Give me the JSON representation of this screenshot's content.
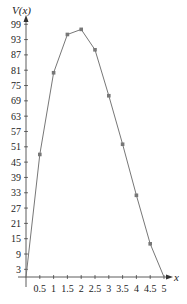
{
  "chart_data": {
    "type": "line",
    "title": "",
    "xlabel": "x",
    "ylabel": "V(x)",
    "x": [
      0,
      0.5,
      1,
      1.5,
      2,
      2.5,
      3,
      3.5,
      4,
      4.5,
      5
    ],
    "series": [
      {
        "name": "V(x)",
        "values": [
          0,
          48,
          80,
          95,
          97,
          89,
          71,
          52,
          32,
          13,
          0
        ]
      }
    ],
    "xlim": [
      0,
      5
    ],
    "ylim": [
      0,
      99
    ],
    "x_ticks": [
      "0.5",
      "1",
      "1.5",
      "2",
      "2.5",
      "3",
      "3.5",
      "4",
      "4.5",
      "5"
    ],
    "y_ticks": [
      "3",
      "9",
      "15",
      "21",
      "27",
      "33",
      "39",
      "45",
      "51",
      "57",
      "63",
      "69",
      "75",
      "81",
      "87",
      "93",
      "99"
    ],
    "grid": false,
    "markers": true,
    "colors": {
      "line": "#777777",
      "marker": "#777777",
      "axis": "#333333"
    }
  }
}
